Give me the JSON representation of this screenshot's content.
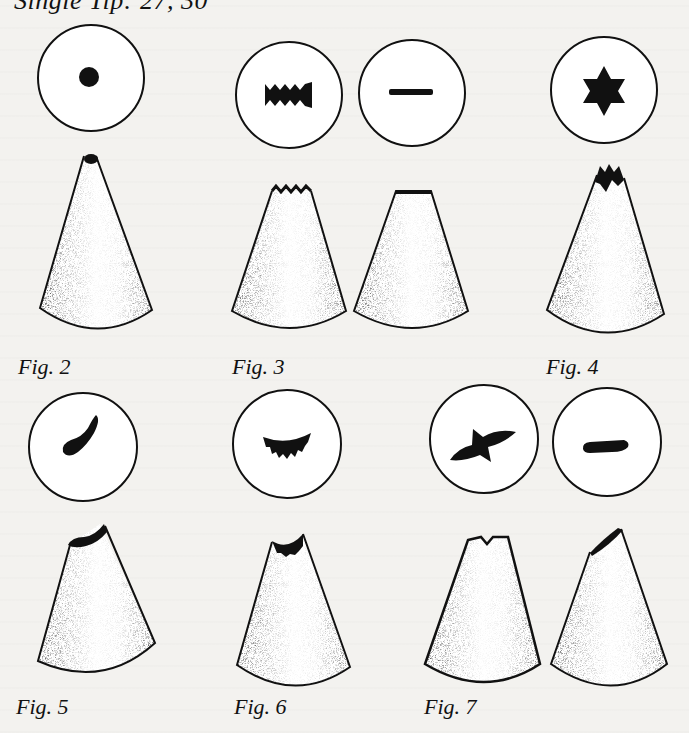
{
  "header": {
    "cut_text": "Single Tip:  27, 30"
  },
  "figures": [
    {
      "label": "Fig. 2",
      "tips": [
        {
          "opening": "round-dot",
          "cone": "round-tip"
        }
      ]
    },
    {
      "label": "Fig. 3",
      "tips": [
        {
          "opening": "zigzag-band",
          "cone": "serrated-flat-tip"
        },
        {
          "opening": "flat-line",
          "cone": "flat-tip"
        }
      ]
    },
    {
      "label": "Fig. 4",
      "tips": [
        {
          "opening": "six-point-star",
          "cone": "star-tip"
        }
      ]
    },
    {
      "label": "Fig. 5",
      "tips": [
        {
          "opening": "curved-comma",
          "cone": "curved-tip"
        }
      ]
    },
    {
      "label": "Fig. 6",
      "tips": [
        {
          "opening": "serrated-crescent",
          "cone": "crescent-tip"
        }
      ]
    },
    {
      "label": "Fig. 7",
      "tips": [
        {
          "opening": "leaf-cross",
          "cone": "notched-leaf-tip"
        },
        {
          "opening": "tapered-teardrop",
          "cone": "slanted-petal-tip"
        }
      ]
    }
  ],
  "colors": {
    "paper": "#f3f2ef",
    "ink": "#111111"
  }
}
